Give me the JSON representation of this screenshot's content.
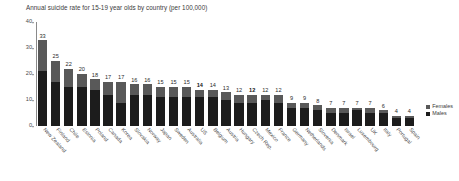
{
  "chart_data": {
    "type": "bar",
    "title": "Annual suicide rate for 15-19 year olds by country (per 100,000)",
    "xlabel": "",
    "ylabel": "",
    "ylim": [
      0,
      40
    ],
    "yticks": [
      0,
      10,
      20,
      30,
      40
    ],
    "grid": false,
    "stacked": true,
    "legend_position": "right",
    "colors": {
      "females": "#595959",
      "males": "#1c1c1c",
      "axis": "#8a8a8a",
      "text": "#3a3a3a"
    },
    "categories": [
      "New Zealand",
      "Finland",
      "Chile",
      "Estonia",
      "Poland",
      "Canada",
      "Korea",
      "Slovakia",
      "Norway",
      "Japan",
      "Sweden",
      "Australia",
      "US",
      "Belgium",
      "Austria",
      "Hungary",
      "Czech Rep.",
      "Mexico",
      "France",
      "Germany",
      "Netherlands",
      "Slovenia",
      "Denmark",
      "Israel",
      "Luxembourg",
      "UK",
      "Italy",
      "Portugal",
      "Spain"
    ],
    "totals": [
      33,
      25,
      22,
      20,
      18,
      17,
      17,
      16,
      16,
      15,
      15,
      15,
      14,
      14,
      13,
      12,
      12,
      12,
      12,
      9,
      9,
      8,
      7,
      7,
      7,
      7,
      6,
      4,
      4
    ],
    "bold_labels": [
      "US",
      "Czech Rep."
    ],
    "series": [
      {
        "name": "Males",
        "color": "#1c1c1c",
        "values": [
          21,
          17,
          15,
          15,
          14,
          12,
          9,
          12,
          12,
          11,
          11,
          11,
          11,
          11,
          10,
          9,
          9,
          10,
          9,
          7,
          7,
          6,
          5,
          5,
          6,
          5,
          5,
          3,
          3
        ]
      },
      {
        "name": "Females",
        "color": "#595959",
        "values": [
          12,
          8,
          7,
          5,
          4,
          5,
          8,
          4,
          4,
          4,
          4,
          4,
          3,
          3,
          3,
          3,
          3,
          2,
          3,
          2,
          2,
          2,
          2,
          2,
          1,
          2,
          1,
          1,
          1
        ]
      }
    ],
    "legend": [
      {
        "label": "Females",
        "color": "#595959"
      },
      {
        "label": "Males",
        "color": "#1c1c1c"
      }
    ]
  }
}
